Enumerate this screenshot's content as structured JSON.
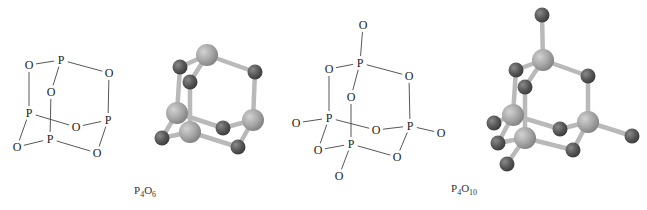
{
  "figures": [
    {
      "id": "p4o6",
      "formula": {
        "element1": "P",
        "count1": "4",
        "element2": "O",
        "count2": "6"
      },
      "structure_2d": {
        "atoms": [
          {
            "el": "O",
            "x": 29,
            "y": 65
          },
          {
            "el": "P",
            "x": 61,
            "y": 60
          },
          {
            "el": "O",
            "x": 109,
            "y": 73
          },
          {
            "el": "O",
            "x": 51,
            "y": 92
          },
          {
            "el": "P",
            "x": 29,
            "y": 113
          },
          {
            "el": "O",
            "x": 76,
            "y": 127
          },
          {
            "el": "P",
            "x": 108,
            "y": 120
          },
          {
            "el": "O",
            "x": 17,
            "y": 147
          },
          {
            "el": "P",
            "x": 50,
            "y": 139
          },
          {
            "el": "O",
            "x": 97,
            "y": 153
          }
        ],
        "bonds": [
          [
            0,
            1
          ],
          [
            1,
            2
          ],
          [
            1,
            3
          ],
          [
            0,
            4
          ],
          [
            2,
            6
          ],
          [
            3,
            8
          ],
          [
            4,
            5
          ],
          [
            5,
            6
          ],
          [
            4,
            7
          ],
          [
            7,
            8
          ],
          [
            8,
            9
          ],
          [
            9,
            6
          ]
        ]
      },
      "ball_model": {
        "phosphorus_color": "#a8a8a8",
        "oxygen_color": "#5a5a5a",
        "atoms": [
          {
            "el": "P",
            "x": 207,
            "y": 55
          },
          {
            "el": "O",
            "x": 180,
            "y": 67
          },
          {
            "el": "O",
            "x": 190,
            "y": 82
          },
          {
            "el": "O",
            "x": 255,
            "y": 72
          },
          {
            "el": "P",
            "x": 177,
            "y": 113
          },
          {
            "el": "P",
            "x": 253,
            "y": 120
          },
          {
            "el": "O",
            "x": 223,
            "y": 128
          },
          {
            "el": "P",
            "x": 190,
            "y": 132
          },
          {
            "el": "O",
            "x": 162,
            "y": 138
          },
          {
            "el": "O",
            "x": 238,
            "y": 147
          }
        ],
        "bonds": [
          [
            0,
            1
          ],
          [
            0,
            2
          ],
          [
            0,
            3
          ],
          [
            1,
            4
          ],
          [
            3,
            5
          ],
          [
            2,
            7
          ],
          [
            4,
            6
          ],
          [
            6,
            5
          ],
          [
            4,
            8
          ],
          [
            8,
            7
          ],
          [
            7,
            9
          ],
          [
            9,
            5
          ]
        ]
      }
    },
    {
      "id": "p4o10",
      "formula": {
        "element1": "P",
        "count1": "4",
        "element2": "O",
        "count2": "10"
      },
      "structure_2d": {
        "atoms": [
          {
            "el": "O",
            "x": 363,
            "y": 25
          },
          {
            "el": "P",
            "x": 360,
            "y": 63
          },
          {
            "el": "O",
            "x": 329,
            "y": 69
          },
          {
            "el": "O",
            "x": 409,
            "y": 76
          },
          {
            "el": "O",
            "x": 351,
            "y": 97
          },
          {
            "el": "P",
            "x": 329,
            "y": 118
          },
          {
            "el": "O",
            "x": 296,
            "y": 123
          },
          {
            "el": "O",
            "x": 376,
            "y": 130
          },
          {
            "el": "P",
            "x": 410,
            "y": 126
          },
          {
            "el": "O",
            "x": 441,
            "y": 133
          },
          {
            "el": "O",
            "x": 318,
            "y": 150
          },
          {
            "el": "P",
            "x": 351,
            "y": 144
          },
          {
            "el": "O",
            "x": 397,
            "y": 157
          },
          {
            "el": "O",
            "x": 339,
            "y": 176
          }
        ],
        "bonds": [
          [
            0,
            1
          ],
          [
            1,
            2
          ],
          [
            1,
            3
          ],
          [
            1,
            4
          ],
          [
            2,
            5
          ],
          [
            3,
            8
          ],
          [
            4,
            11
          ],
          [
            5,
            6
          ],
          [
            5,
            7
          ],
          [
            7,
            8
          ],
          [
            8,
            9
          ],
          [
            5,
            10
          ],
          [
            10,
            11
          ],
          [
            11,
            12
          ],
          [
            12,
            8
          ],
          [
            11,
            13
          ]
        ]
      },
      "ball_model": {
        "phosphorus_color": "#a8a8a8",
        "oxygen_color": "#5a5a5a",
        "atoms": [
          {
            "el": "O",
            "x": 542,
            "y": 15
          },
          {
            "el": "P",
            "x": 543,
            "y": 60
          },
          {
            "el": "O",
            "x": 516,
            "y": 70
          },
          {
            "el": "O",
            "x": 525,
            "y": 87
          },
          {
            "el": "O",
            "x": 588,
            "y": 76
          },
          {
            "el": "P",
            "x": 513,
            "y": 115
          },
          {
            "el": "O",
            "x": 494,
            "y": 123
          },
          {
            "el": "P",
            "x": 588,
            "y": 122
          },
          {
            "el": "O",
            "x": 560,
            "y": 129
          },
          {
            "el": "O",
            "x": 632,
            "y": 136
          },
          {
            "el": "P",
            "x": 525,
            "y": 138
          },
          {
            "el": "O",
            "x": 498,
            "y": 143
          },
          {
            "el": "O",
            "x": 573,
            "y": 150
          },
          {
            "el": "O",
            "x": 507,
            "y": 164
          }
        ],
        "bonds": [
          [
            0,
            1
          ],
          [
            1,
            2
          ],
          [
            1,
            3
          ],
          [
            1,
            4
          ],
          [
            2,
            5
          ],
          [
            4,
            7
          ],
          [
            3,
            10
          ],
          [
            5,
            6
          ],
          [
            5,
            8
          ],
          [
            8,
            7
          ],
          [
            7,
            9
          ],
          [
            5,
            11
          ],
          [
            11,
            10
          ],
          [
            10,
            12
          ],
          [
            12,
            7
          ],
          [
            10,
            13
          ]
        ]
      }
    }
  ]
}
